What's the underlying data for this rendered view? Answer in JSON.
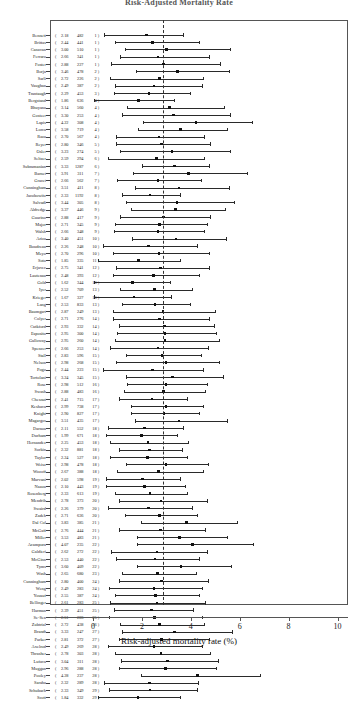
{
  "title": "Risk-Adjusted Mortality Rate",
  "axis": {
    "xlabel": "Risk-adjusted mortality rate (%)",
    "ticks": [
      "0",
      "2",
      "4",
      "6",
      "8",
      "10"
    ]
  },
  "chart_data": {
    "type": "scatter",
    "subtype": "forest-plot",
    "title": "Risk-Adjusted Mortality Rate",
    "xlabel": "Risk-adjusted mortality rate (%)",
    "ylabel": "",
    "xlim": [
      -1.75,
      10.4
    ],
    "grid": false,
    "legend": null,
    "reference_line": 2.85,
    "columns": [
      "surgeon",
      "rate",
      "volume",
      "group"
    ],
    "point_marker": "filled-square",
    "interval_note": "horizontal line = 95% confidence interval, square = risk-adjusted mortality rate",
    "rows": [
      {
        "name": "Bennett",
        "rate": "2.18",
        "volume": "482",
        "group": "1",
        "low": 0.45,
        "high": 3.7
      },
      {
        "name": "Brittas",
        "rate": "2.44",
        "volume": "441",
        "group": "1",
        "low": 0.9,
        "high": 4.35
      },
      {
        "name": "Canavan",
        "rate": "3.00",
        "volume": "510",
        "group": "1",
        "low": 1.3,
        "high": 5.6
      },
      {
        "name": "Ferraro",
        "rate": "2.66",
        "volume": "341",
        "group": "1",
        "low": 1.1,
        "high": 4.75
      },
      {
        "name": "Foster",
        "rate": "2.88",
        "volume": "227",
        "group": "1",
        "low": 0.75,
        "high": 5.2
      },
      {
        "name": "Borja",
        "rate": "3.46",
        "volume": "478",
        "group": "2",
        "low": 1.75,
        "high": 5.55
      },
      {
        "name": "Sarli",
        "rate": "2.72",
        "volume": "226",
        "group": "2",
        "low": 0.7,
        "high": 4.5
      },
      {
        "name": "Vaughan",
        "rate": "2.49",
        "volume": "387",
        "group": "2",
        "low": 0.9,
        "high": 4.45
      },
      {
        "name": "Trantaugh",
        "rate": "2.29",
        "volume": "453",
        "group": "3",
        "low": 0.85,
        "high": 3.95
      },
      {
        "name": "Bergstand",
        "rate": "1.86",
        "volume": "636",
        "group": "4",
        "low": 0.05,
        "high": 3.3
      },
      {
        "name": "Bhuyana",
        "rate": "3.14",
        "volume": "560",
        "group": "4",
        "low": 1.4,
        "high": 5.35
      },
      {
        "name": "Gosteer",
        "rate": "3.30",
        "volume": "253",
        "group": "4",
        "low": 1.2,
        "high": 5.6
      },
      {
        "name": "Lapis",
        "rate": "4.22",
        "volume": "308",
        "group": "4",
        "low": 2.05,
        "high": 6.5
      },
      {
        "name": "Lorca",
        "rate": "3.58",
        "volume": "719",
        "group": "4",
        "low": 1.85,
        "high": 5.5
      },
      {
        "name": "Raza",
        "rate": "2.70",
        "volume": "567",
        "group": "4",
        "low": 0.95,
        "high": 4.55
      },
      {
        "name": "Reyer",
        "rate": "2.80",
        "volume": "346",
        "group": "5",
        "low": 0.95,
        "high": 4.8
      },
      {
        "name": "Osler",
        "rate": "3.23",
        "volume": "274",
        "group": "5",
        "low": 1.1,
        "high": 5.6
      },
      {
        "name": "Seltzer",
        "rate": "2.59",
        "volume": "294",
        "group": "6",
        "low": 0.6,
        "high": 4.55
      },
      {
        "name": "Subramanian",
        "rate": "3.33",
        "volume": "1287",
        "group": "6",
        "low": 2.0,
        "high": 4.75
      },
      {
        "name": "Barnet",
        "rate": "3.91",
        "volume": "311",
        "group": "7",
        "low": 1.65,
        "high": 6.3
      },
      {
        "name": "Gracet",
        "rate": "2.66",
        "volume": "562",
        "group": "7",
        "low": 1.0,
        "high": 4.4
      },
      {
        "name": "Cunningham",
        "rate": "3.51",
        "volume": "411",
        "group": "8",
        "low": 1.7,
        "high": 5.55
      },
      {
        "name": "Jacobowitz",
        "rate": "2.33",
        "volume": "1192",
        "group": "8",
        "low": 1.2,
        "high": 3.55
      },
      {
        "name": "Salvadi",
        "rate": "3.44",
        "volume": "305",
        "group": "8",
        "low": 1.35,
        "high": 5.75
      },
      {
        "name": "Aldredge",
        "rate": "3.37",
        "volume": "446",
        "group": "9",
        "low": 1.55,
        "high": 5.4
      },
      {
        "name": "Guarino",
        "rate": "2.88",
        "volume": "417",
        "group": "9",
        "low": 1.1,
        "high": 4.8
      },
      {
        "name": "Major",
        "rate": "2.71",
        "volume": "345",
        "group": "9",
        "low": 0.9,
        "high": 4.65
      },
      {
        "name": "Walsh",
        "rate": "2.66",
        "volume": "348",
        "group": "9",
        "low": 0.85,
        "high": 4.55
      },
      {
        "name": "Ariza",
        "rate": "3.40",
        "volume": "451",
        "group": "10",
        "low": 1.6,
        "high": 5.45
      },
      {
        "name": "Boudreau",
        "rate": "2.26",
        "volume": "248",
        "group": "10",
        "low": 0.4,
        "high": 4.25
      },
      {
        "name": "Meyo",
        "rate": "2.70",
        "volume": "296",
        "group": "10",
        "low": 0.8,
        "high": 4.75
      },
      {
        "name": "Soto",
        "rate": "1.85",
        "volume": "335",
        "group": "11",
        "low": 0.2,
        "high": 3.55
      },
      {
        "name": "Erjavec",
        "rate": "2.75",
        "volume": "341",
        "group": "12",
        "low": 0.95,
        "high": 4.75
      },
      {
        "name": "Lautenau",
        "rate": "2.48",
        "volume": "393",
        "group": "12",
        "low": 0.8,
        "high": 4.35
      },
      {
        "name": "Gold",
        "rate": "1.62",
        "volume": "344",
        "group": "13",
        "low": 0.05,
        "high": 3.15
      },
      {
        "name": "Iyer",
        "rate": "2.52",
        "volume": "709",
        "group": "13",
        "low": 1.1,
        "high": 4.05
      },
      {
        "name": "Krieger",
        "rate": "1.67",
        "volume": "327",
        "group": "13",
        "low": 0.05,
        "high": 3.2
      },
      {
        "name": "Lang",
        "rate": "2.53",
        "volume": "833",
        "group": "13",
        "low": 1.2,
        "high": 3.95
      },
      {
        "name": "Baumgart",
        "rate": "2.87",
        "volume": "249",
        "group": "13",
        "low": 0.8,
        "high": 5.0
      },
      {
        "name": "Colyer",
        "rate": "2.71",
        "volume": "276",
        "group": "14",
        "low": 0.8,
        "high": 4.75
      },
      {
        "name": "Cutkford",
        "rate": "2.93",
        "volume": "332",
        "group": "14",
        "low": 1.05,
        "high": 4.95
      },
      {
        "name": "Esposito",
        "rate": "2.95",
        "volume": "300",
        "group": "14",
        "low": 1.0,
        "high": 5.05
      },
      {
        "name": "Galloway",
        "rate": "2.95",
        "volume": "260",
        "group": "14",
        "low": 0.9,
        "high": 5.15
      },
      {
        "name": "Spencer",
        "rate": "2.66",
        "volume": "253",
        "group": "14",
        "low": 0.7,
        "high": 4.7
      },
      {
        "name": "Stall",
        "rate": "2.83",
        "volume": "596",
        "group": "15",
        "low": 1.35,
        "high": 4.4
      },
      {
        "name": "Nelson",
        "rate": "2.98",
        "volume": "268",
        "group": "15",
        "low": 0.95,
        "high": 5.15
      },
      {
        "name": "Pogo",
        "rate": "2.44",
        "volume": "223",
        "group": "15",
        "low": 0.4,
        "high": 4.5
      },
      {
        "name": "Tortolani",
        "rate": "3.24",
        "volume": "345",
        "group": "15",
        "low": 1.35,
        "high": 5.3
      },
      {
        "name": "Rose",
        "rate": "2.98",
        "volume": "512",
        "group": "16",
        "low": 1.4,
        "high": 4.65
      },
      {
        "name": "Swash",
        "rate": "2.88",
        "volume": "483",
        "group": "16",
        "low": 1.25,
        "high": 4.6
      },
      {
        "name": "Chesnut",
        "rate": "2.41",
        "volume": "715",
        "group": "17",
        "low": 1.05,
        "high": 3.85
      },
      {
        "name": "Keshava",
        "rate": "2.99",
        "volume": "738",
        "group": "17",
        "low": 1.55,
        "high": 4.5
      },
      {
        "name": "Knight",
        "rate": "2.90",
        "volume": "827",
        "group": "17",
        "low": 1.55,
        "high": 4.35
      },
      {
        "name": "Magargos",
        "rate": "3.51",
        "volume": "435",
        "group": "17",
        "low": 1.7,
        "high": 5.5
      },
      {
        "name": "Darnoa",
        "rate": "2.11",
        "volume": "552",
        "group": "18",
        "low": 0.6,
        "high": 3.7
      },
      {
        "name": "Durham",
        "rate": "1.99",
        "volume": "671",
        "group": "18",
        "low": 0.55,
        "high": 3.45
      },
      {
        "name": "Hernandez",
        "rate": "2.25",
        "volume": "453",
        "group": "18",
        "low": 0.7,
        "high": 3.9
      },
      {
        "name": "Sorkin",
        "rate": "2.32",
        "volume": "881",
        "group": "18",
        "low": 1.05,
        "high": 3.65
      },
      {
        "name": "Taylor",
        "rate": "2.24",
        "volume": "527",
        "group": "18",
        "low": 0.7,
        "high": 3.85
      },
      {
        "name": "Weisz",
        "rate": "2.98",
        "volume": "478",
        "group": "18",
        "low": 1.35,
        "high": 4.7
      },
      {
        "name": "Wozoff",
        "rate": "2.67",
        "volume": "388",
        "group": "18",
        "low": 1.0,
        "high": 4.5
      },
      {
        "name": "Marvani",
        "rate": "2.02",
        "volume": "598",
        "group": "19",
        "low": 0.55,
        "high": 3.55
      },
      {
        "name": "Nazou",
        "rate": "2.10",
        "volume": "443",
        "group": "19",
        "low": 0.55,
        "high": 3.75
      },
      {
        "name": "Rosenberg",
        "rate": "2.33",
        "volume": "613",
        "group": "19",
        "low": 0.9,
        "high": 3.85
      },
      {
        "name": "Mendrib",
        "rate": "2.78",
        "volume": "373",
        "group": "20",
        "low": 1.05,
        "high": 4.65
      },
      {
        "name": "Swaird",
        "rate": "2.26",
        "volume": "379",
        "group": "20",
        "low": 0.6,
        "high": 4.05
      },
      {
        "name": "Zadeh",
        "rate": "2.71",
        "volume": "636",
        "group": "20",
        "low": 1.3,
        "high": 4.25
      },
      {
        "name": "Dal Col",
        "rate": "3.83",
        "volume": "385",
        "group": "21",
        "low": 1.95,
        "high": 5.9
      },
      {
        "name": "McGaff",
        "rate": "2.76",
        "volume": "444",
        "group": "21",
        "low": 1.05,
        "high": 4.6
      },
      {
        "name": "Miller",
        "rate": "3.53",
        "volume": "483",
        "group": "21",
        "low": 1.8,
        "high": 5.5
      },
      {
        "name": "Acampora",
        "rate": "4.07",
        "volume": "235",
        "group": "22",
        "low": 1.8,
        "high": 6.55
      },
      {
        "name": "Galdieri",
        "rate": "2.62",
        "volume": "272",
        "group": "22",
        "low": 0.75,
        "high": 4.65
      },
      {
        "name": "McGinn",
        "rate": "2.53",
        "volume": "440",
        "group": "22",
        "low": 0.95,
        "high": 4.35
      },
      {
        "name": "Tyms",
        "rate": "3.60",
        "volume": "409",
        "group": "22",
        "low": 1.8,
        "high": 5.65
      },
      {
        "name": "Wash",
        "rate": "2.65",
        "volume": "680",
        "group": "23",
        "low": 1.2,
        "high": 4.2
      },
      {
        "name": "Cunningham",
        "rate": "2.80",
        "volume": "400",
        "group": "24",
        "low": 1.05,
        "high": 4.7
      },
      {
        "name": "Weng",
        "rate": "2.49",
        "volume": "283",
        "group": "24",
        "low": 0.65,
        "high": 4.45
      },
      {
        "name": "Yousuf",
        "rate": "2.55",
        "volume": "387",
        "group": "24",
        "low": 0.9,
        "high": 4.35
      },
      {
        "name": "Bellinger",
        "rate": "2.61",
        "volume": "283",
        "group": "25",
        "low": 0.7,
        "high": 4.6
      },
      {
        "name": "Harman",
        "rate": "2.39",
        "volume": "451",
        "group": "25",
        "low": 0.85,
        "high": 4.1
      },
      {
        "name": "Se-Sen",
        "rate": "2.51",
        "volume": "286",
        "group": "25",
        "low": 0.65,
        "high": 4.45
      },
      {
        "name": "Zubtrial",
        "rate": "2.72",
        "volume": "438",
        "group": "26",
        "low": 1.1,
        "high": 4.55
      },
      {
        "name": "Brandt",
        "rate": "3.33",
        "volume": "247",
        "group": "27",
        "low": 1.2,
        "high": 5.7
      },
      {
        "name": "Parker",
        "rate": "2.81",
        "volume": "372",
        "group": "27",
        "low": 1.05,
        "high": 4.75
      },
      {
        "name": "Axelrod",
        "rate": "2.49",
        "volume": "269",
        "group": "28",
        "low": 0.6,
        "high": 4.45
      },
      {
        "name": "Thrasher",
        "rate": "2.78",
        "volume": "303",
        "group": "28",
        "low": 0.9,
        "high": 4.8
      },
      {
        "name": "Lufava",
        "rate": "3.04",
        "volume": "311",
        "group": "28",
        "low": 1.15,
        "high": 5.1
      },
      {
        "name": "Muggan",
        "rate": "2.96",
        "volume": "288",
        "group": "28",
        "low": 1.05,
        "high": 5.05
      },
      {
        "name": "Pooley",
        "rate": "4.28",
        "volume": "237",
        "group": "28",
        "low": 1.95,
        "high": 6.85
      },
      {
        "name": "Saraha",
        "rate": "2.32",
        "volume": "289",
        "group": "28",
        "low": 0.45,
        "high": 4.3
      },
      {
        "name": "Schubach",
        "rate": "2.33",
        "volume": "349",
        "group": "29",
        "low": 0.65,
        "high": 4.25
      },
      {
        "name": "Scott",
        "rate": "1.84",
        "volume": "332",
        "group": "29",
        "low": 0.2,
        "high": 3.55
      }
    ]
  }
}
